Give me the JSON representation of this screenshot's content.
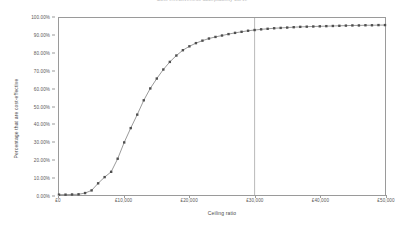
{
  "chart_data": {
    "type": "line",
    "title": "Cost-effectiveness acceptability curve",
    "xlabel": "Ceiling ratio",
    "ylabel": "Percentage that are cost-effective",
    "xlim": [
      0,
      50000
    ],
    "ylim": [
      0,
      1.0
    ],
    "grid": false,
    "legend": false,
    "marker": "square",
    "x_tick_labels": [
      "£0",
      "£10,000",
      "£20,000",
      "£30,000",
      "£40,000",
      "£50,000"
    ],
    "x_tick_values": [
      0,
      10000,
      20000,
      30000,
      40000,
      50000
    ],
    "y_tick_labels": [
      "0.00%",
      "10.00%",
      "20.00%",
      "30.00%",
      "40.00%",
      "50.00%",
      "60.00%",
      "70.00%",
      "80.00%",
      "90.00%",
      "100.00%"
    ],
    "y_tick_values": [
      0,
      0.1,
      0.2,
      0.3,
      0.4,
      0.5,
      0.6,
      0.7,
      0.8,
      0.9,
      1.0
    ],
    "annotations": [
      {
        "name": "threshold-line",
        "type": "vline",
        "x": 30000,
        "label": "£30,000 threshold"
      }
    ],
    "series": [
      {
        "name": "Percentage cost-effective",
        "x": [
          0,
          1000,
          2000,
          3000,
          4000,
          5000,
          6000,
          7000,
          8000,
          9000,
          10000,
          11000,
          12000,
          13000,
          14000,
          15000,
          16000,
          17000,
          18000,
          19000,
          20000,
          21000,
          22000,
          23000,
          24000,
          25000,
          26000,
          27000,
          28000,
          29000,
          30000,
          31000,
          32000,
          33000,
          34000,
          35000,
          36000,
          37000,
          38000,
          39000,
          40000,
          41000,
          42000,
          43000,
          44000,
          45000,
          46000,
          47000,
          48000,
          49000,
          50000
        ],
        "values": [
          0.002,
          0.002,
          0.003,
          0.004,
          0.011,
          0.026,
          0.066,
          0.101,
          0.131,
          0.205,
          0.297,
          0.378,
          0.454,
          0.535,
          0.602,
          0.658,
          0.709,
          0.752,
          0.788,
          0.818,
          0.84,
          0.858,
          0.872,
          0.884,
          0.893,
          0.901,
          0.909,
          0.916,
          0.922,
          0.928,
          0.932,
          0.936,
          0.939,
          0.942,
          0.944,
          0.946,
          0.948,
          0.95,
          0.951,
          0.952,
          0.953,
          0.954,
          0.955,
          0.956,
          0.957,
          0.958,
          0.958,
          0.959,
          0.959,
          0.96,
          0.96
        ]
      }
    ]
  },
  "colors": {
    "series": "#4f4f4f",
    "line": "#6d6d6d",
    "axis": "#9a9a9a",
    "text": "#4a4a4a",
    "background": "#ffffff"
  }
}
